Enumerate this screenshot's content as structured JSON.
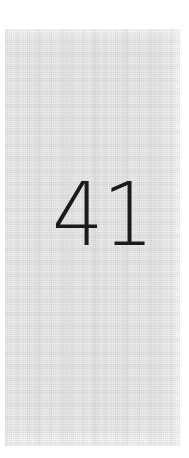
{
  "document": {
    "kind": "scanned-book-page",
    "page_number": "41",
    "visible_text": "41",
    "body_text": "",
    "colors": {
      "page_margin": "#ffffff",
      "paper": "#ededed",
      "paper_highlight": "#f6f6f6",
      "grain": "#969696",
      "ink": "#1b1b1b"
    }
  },
  "folio": {
    "label": "41",
    "position": "upper-right-of-center",
    "alignment": "center-right"
  }
}
